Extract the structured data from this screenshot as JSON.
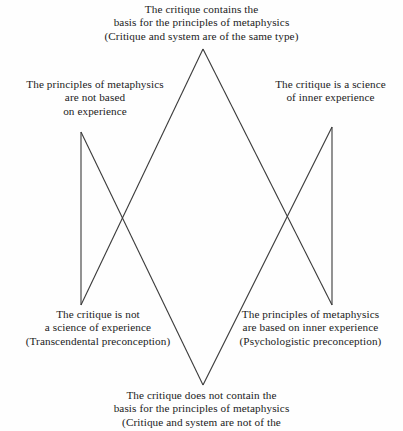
{
  "figure": {
    "background_color": "#fefefe",
    "line_color": "#3a3a3a",
    "text_color": "#1b1b1b"
  },
  "nodes": {
    "top": {
      "name": "top-proposition",
      "lines": [
        "The critique contains the",
        "basis for the principles of metaphysics",
        "(Critique and system are of the same type)"
      ]
    },
    "upper_left": {
      "name": "upper-left-proposition",
      "lines": [
        "The principles of metaphysics",
        "are not based",
        "on experience"
      ]
    },
    "upper_right": {
      "name": "upper-right-proposition",
      "lines": [
        "The critique is a science",
        "of inner experience"
      ]
    },
    "lower_left": {
      "name": "lower-left-proposition",
      "lines": [
        "The critique is not",
        "a  science  of  experience",
        "(Transcendental preconception)"
      ]
    },
    "lower_right": {
      "name": "lower-right-proposition",
      "lines": [
        "The principles of metaphysics",
        "are based on inner experience",
        "(Psychologistic preconception)"
      ]
    },
    "bottom": {
      "name": "bottom-proposition",
      "lines": [
        "The critique does not contain the",
        "basis for the principles of metaphysics",
        "(Critique and system are not of the"
      ]
    }
  },
  "edges": [
    {
      "name": "edge-top-to-lower-left",
      "x1": 203,
      "y1": 49,
      "x2": 81,
      "y2": 305
    },
    {
      "name": "edge-top-to-lower-right",
      "x1": 203,
      "y1": 49,
      "x2": 332,
      "y2": 305
    },
    {
      "name": "edge-bottom-to-upper-left",
      "x1": 203,
      "y1": 385,
      "x2": 81,
      "y2": 132
    },
    {
      "name": "edge-bottom-to-upper-right",
      "x1": 203,
      "y1": 385,
      "x2": 332,
      "y2": 127
    },
    {
      "name": "edge-left-vertical",
      "x1": 81,
      "y1": 132,
      "x2": 81,
      "y2": 305
    },
    {
      "name": "edge-right-vertical",
      "x1": 332,
      "y1": 127,
      "x2": 332,
      "y2": 305
    }
  ]
}
